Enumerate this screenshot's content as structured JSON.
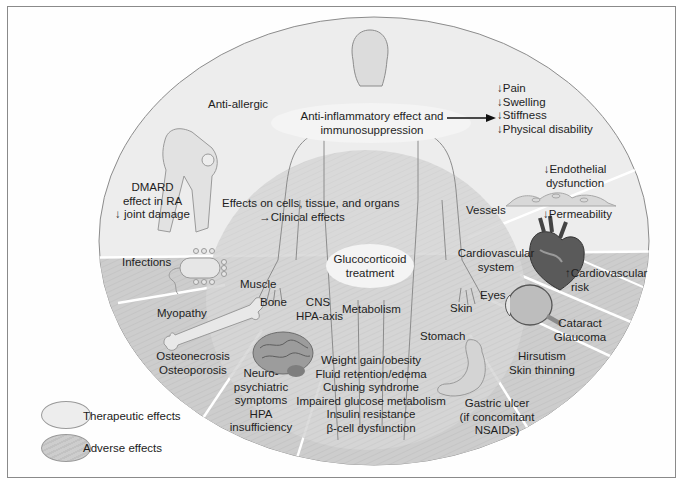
{
  "diagram": {
    "title": "Glucocorticoid treatment",
    "center_label": "Glucocorticoid treatment",
    "inner_label": "Effects on cells, tissue, and organs →Clinical effects",
    "inner_label_line1": "Effects on cells, tissue, and organs",
    "inner_label_line2": "→Clinical effects",
    "colors": {
      "therapeutic": "#ececec",
      "adverse": "#cfcfcf",
      "inner": "#d9d9d9",
      "outline": "#8c8c8c"
    },
    "therapeutic": {
      "anti_inflammatory": {
        "line1": "Anti-inflammatory effect and",
        "line2": "immunosuppression",
        "outcomes": [
          "↓Pain",
          "↓Swelling",
          "↓Stiffness",
          "↓Physical disability"
        ]
      },
      "anti_allergic": "Anti-allergic",
      "dmard": {
        "line1": "DMARD",
        "line2": "effect in RA",
        "line3": "↓ joint damage"
      },
      "vessels": {
        "label": "Vessels",
        "endothelial_line1": "↓Endothelial",
        "endothelial_line2": "dysfunction",
        "permeability": "↓Permeability"
      }
    },
    "organs": {
      "muscle": "Muscle",
      "bone": "Bone",
      "cns_line1": "CNS",
      "cns_line2": "HPA-axis",
      "metabolism": "Metabolism",
      "skin": "Skin",
      "eyes": "Eyes",
      "cardio_line1": "Cardiovascular",
      "cardio_line2": "system",
      "stomach": "Stomach"
    },
    "adverse": {
      "infections": "Infections",
      "myopathy": "Myopathy",
      "bone_line1": "Osteonecrosis",
      "bone_line2": "Osteoporosis",
      "neuro": [
        "Neuro-",
        "psychiatric",
        "symptoms",
        "HPA",
        "insufficiency"
      ],
      "metabolic": [
        "Weight gain/obesity",
        "Fluid retention/edema",
        "Cushing syndrome",
        "Impaired glucose metabolism",
        "Insulin resistance",
        "β-cell dysfunction"
      ],
      "gastric": [
        "Gastric ulcer",
        "(if concomitant",
        "NSAIDs)"
      ],
      "skin_line1": "Hirsutism",
      "skin_line2": "Skin thinning",
      "eyes_line1": "Cataract",
      "eyes_line2": "Glaucoma",
      "cardio_line1": "↑Cardiovascular",
      "cardio_line2": "risk"
    },
    "legend": {
      "therapeutic": "Therapeutic effects",
      "adverse": "Adverse effects"
    }
  }
}
